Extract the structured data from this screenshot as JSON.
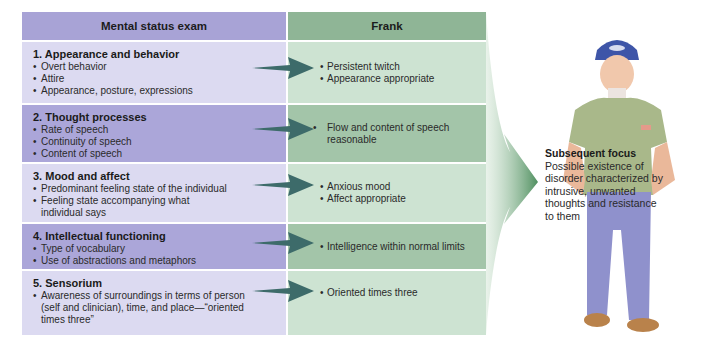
{
  "table": {
    "left_header": "Mental status exam",
    "right_header": "Frank",
    "rows": [
      {
        "title": "1. Appearance and behavior",
        "items": [
          "Overt behavior",
          "Attire",
          "Appearance, posture, expressions"
        ],
        "findings": [
          "Persistent twitch",
          "Appearance appropriate"
        ]
      },
      {
        "title": "2. Thought processes",
        "items": [
          "Rate of speech",
          "Continuity of speech",
          "Content of speech"
        ],
        "findings": [
          "Flow and content of speech reasonable"
        ]
      },
      {
        "title": "3. Mood and affect",
        "items": [
          "Predominant feeling state of the individual",
          "Feeling state accompanying what individual says"
        ],
        "findings": [
          "Anxious mood",
          "Affect appropriate"
        ]
      },
      {
        "title": "4. Intellectual functioning",
        "items": [
          "Type of vocabulary",
          "Use of abstractions and metaphors"
        ],
        "findings": [
          "Intelligence within normal limits"
        ]
      },
      {
        "title": "5. Sensorium",
        "items": [
          "Awareness of surroundings in terms of person (self and clinician), time, and place—“oriented times three”"
        ],
        "findings": [
          "Oriented times three"
        ]
      }
    ]
  },
  "subsequent_focus": {
    "title": "Subsequent focus",
    "text": "Possible existence of disorder characterized by intrusive, unwanted thoughts and resistance to them"
  },
  "bullet": "•",
  "colors": {
    "left_header": "#a8a3d6",
    "right_header": "#8fb596",
    "left_light": "#dcdaf1",
    "left_dark": "#aba6d9",
    "right_light": "#cde3d2",
    "right_dark": "#a3c5a9",
    "arrow": "#3d6b6a"
  }
}
